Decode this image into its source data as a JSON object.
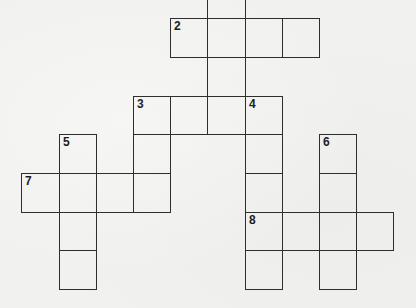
{
  "puzzle": {
    "type": "crossword",
    "cell_size_px": 37.5,
    "colors": {
      "background": "#f1f1ef",
      "grid_line": "#2e2e2e",
      "number": "#1e1e1e"
    },
    "clue_numbers": [
      "2",
      "3",
      "4",
      "5",
      "6",
      "7",
      "8"
    ],
    "entries": [
      {
        "id": "1-down-partial",
        "number": "",
        "direction": "down",
        "length": 4,
        "note": "continues above visible area",
        "cells": [
          [
            207,
            -20
          ],
          [
            207,
            18
          ],
          [
            207,
            57
          ],
          [
            207,
            96
          ]
        ]
      },
      {
        "id": "2-across",
        "number": "2",
        "direction": "across",
        "length": 4,
        "cells": [
          [
            170,
            18
          ],
          [
            207,
            18
          ],
          [
            245,
            18
          ],
          [
            282,
            18
          ]
        ]
      },
      {
        "id": "3-across",
        "number": "3",
        "direction": "across",
        "length": 4,
        "cells": [
          [
            133,
            96
          ],
          [
            170,
            96
          ],
          [
            207,
            96
          ],
          [
            245,
            96
          ]
        ]
      },
      {
        "id": "3-down",
        "number": "3",
        "direction": "down",
        "length": 3,
        "cells": [
          [
            133,
            96
          ],
          [
            133,
            134
          ],
          [
            133,
            173
          ]
        ]
      },
      {
        "id": "4-down",
        "number": "4",
        "direction": "down",
        "length": 5,
        "cells": [
          [
            245,
            96
          ],
          [
            245,
            134
          ],
          [
            245,
            173
          ],
          [
            245,
            212
          ],
          [
            245,
            250
          ]
        ]
      },
      {
        "id": "5-down",
        "number": "5",
        "direction": "down",
        "length": 4,
        "cells": [
          [
            59,
            134
          ],
          [
            59,
            173
          ],
          [
            59,
            212
          ],
          [
            59,
            250
          ]
        ]
      },
      {
        "id": "6-down",
        "number": "6",
        "direction": "down",
        "length": 4,
        "cells": [
          [
            319,
            134
          ],
          [
            319,
            173
          ],
          [
            319,
            212
          ],
          [
            319,
            250
          ]
        ]
      },
      {
        "id": "7-across",
        "number": "7",
        "direction": "across",
        "length": 4,
        "cells": [
          [
            21,
            173
          ],
          [
            59,
            173
          ],
          [
            96,
            173
          ],
          [
            133,
            173
          ]
        ]
      },
      {
        "id": "8-across",
        "number": "8",
        "direction": "across",
        "length": 4,
        "cells": [
          [
            245,
            212
          ],
          [
            282,
            212
          ],
          [
            319,
            212
          ],
          [
            356,
            212
          ]
        ]
      }
    ],
    "cells": [
      {
        "x": 207,
        "y": -20,
        "w": 38,
        "h": 38,
        "label": ""
      },
      {
        "x": 170,
        "y": 18,
        "w": 37,
        "h": 39,
        "label": "2"
      },
      {
        "x": 207,
        "y": 18,
        "w": 38,
        "h": 39,
        "label": ""
      },
      {
        "x": 245,
        "y": 18,
        "w": 37,
        "h": 39,
        "label": ""
      },
      {
        "x": 282,
        "y": 18,
        "w": 37,
        "h": 39,
        "label": ""
      },
      {
        "x": 207,
        "y": 57,
        "w": 38,
        "h": 39,
        "label": ""
      },
      {
        "x": 133,
        "y": 96,
        "w": 37,
        "h": 38,
        "label": "3"
      },
      {
        "x": 170,
        "y": 96,
        "w": 37,
        "h": 38,
        "label": ""
      },
      {
        "x": 207,
        "y": 96,
        "w": 38,
        "h": 38,
        "label": ""
      },
      {
        "x": 245,
        "y": 96,
        "w": 37,
        "h": 38,
        "label": "4"
      },
      {
        "x": 59,
        "y": 134,
        "w": 37,
        "h": 39,
        "label": "5"
      },
      {
        "x": 133,
        "y": 134,
        "w": 37,
        "h": 39,
        "label": ""
      },
      {
        "x": 245,
        "y": 134,
        "w": 37,
        "h": 39,
        "label": ""
      },
      {
        "x": 319,
        "y": 134,
        "w": 37,
        "h": 39,
        "label": "6"
      },
      {
        "x": 21,
        "y": 173,
        "w": 38,
        "h": 39,
        "label": "7"
      },
      {
        "x": 59,
        "y": 173,
        "w": 37,
        "h": 39,
        "label": ""
      },
      {
        "x": 96,
        "y": 173,
        "w": 37,
        "h": 39,
        "label": ""
      },
      {
        "x": 133,
        "y": 173,
        "w": 37,
        "h": 39,
        "label": ""
      },
      {
        "x": 245,
        "y": 173,
        "w": 37,
        "h": 39,
        "label": ""
      },
      {
        "x": 319,
        "y": 173,
        "w": 37,
        "h": 39,
        "label": ""
      },
      {
        "x": 59,
        "y": 212,
        "w": 37,
        "h": 38,
        "label": ""
      },
      {
        "x": 245,
        "y": 212,
        "w": 37,
        "h": 38,
        "label": "8"
      },
      {
        "x": 282,
        "y": 212,
        "w": 37,
        "h": 38,
        "label": ""
      },
      {
        "x": 319,
        "y": 212,
        "w": 37,
        "h": 38,
        "label": ""
      },
      {
        "x": 356,
        "y": 212,
        "w": 37,
        "h": 38,
        "label": ""
      },
      {
        "x": 59,
        "y": 250,
        "w": 37,
        "h": 39,
        "label": ""
      },
      {
        "x": 245,
        "y": 250,
        "w": 37,
        "h": 39,
        "label": ""
      },
      {
        "x": 319,
        "y": 250,
        "w": 37,
        "h": 39,
        "label": ""
      }
    ]
  }
}
